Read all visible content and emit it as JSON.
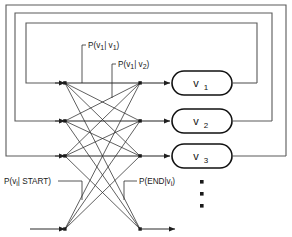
{
  "figure": {
    "background_color": "#ffffff",
    "line_color": "#2b2b2b",
    "frame_color": "#5a5a5a"
  },
  "states": [
    {
      "id": "v1",
      "label": "v",
      "subscript": "1",
      "row_y": 83
    },
    {
      "id": "v2",
      "label": "v",
      "subscript": "2",
      "row_y": 121
    },
    {
      "id": "v3",
      "label": "v",
      "subscript": "3",
      "row_y": 156
    }
  ],
  "annotations": [
    {
      "id": "p-v1-given-v1",
      "text": "P(v",
      "sub1": "1",
      "mid": "| v",
      "sub2": "1",
      "close": ")",
      "x": 88,
      "y": 47
    },
    {
      "id": "p-v1-given-v2",
      "text": "P(v",
      "sub1": "1",
      "mid": "| v",
      "sub2": "2",
      "close": ")",
      "x": 118,
      "y": 66
    },
    {
      "id": "p-vi-given-start",
      "text": "P(v",
      "sub1": "i",
      "mid": "| START",
      "sub2": "",
      "close": ")",
      "x": 4,
      "y": 183
    },
    {
      "id": "p-end-given-vi",
      "text": "P(END|v",
      "sub1": "i",
      "mid": "",
      "sub2": "",
      "close": ")",
      "x": 139,
      "y": 183
    }
  ],
  "ellipsis": {
    "id": "more-states-ellipsis",
    "dots": 3,
    "x": 202,
    "y_start": 181,
    "spacing": 12
  },
  "terminals": {
    "start_arrow_label": "START",
    "end_arrow_label": "END",
    "baseline_y": 229
  },
  "loops": [
    {
      "id": "feedback-loop-outer",
      "left_x": 6,
      "top_y": 5,
      "right_x": 286,
      "target_row": 156
    },
    {
      "id": "feedback-loop-middle",
      "left_x": 15,
      "top_y": 13,
      "right_x": 272,
      "target_row": 121
    },
    {
      "id": "feedback-loop-inner",
      "left_x": 26,
      "top_y": 23,
      "right_x": 257,
      "target_row": 83
    }
  ],
  "junctions": {
    "left_x": 65,
    "right_x": 140,
    "bottom_left_x": 65,
    "bottom_right_x": 140
  }
}
